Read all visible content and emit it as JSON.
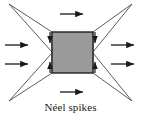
{
  "figure": {
    "caption": "Néel spikes",
    "domain_colors": {
      "core_fill": "#9a9a9a",
      "core_stroke": "#222222",
      "spike_stroke": "#4a4a4a",
      "arrow_color": "#1a1a1a",
      "background": "#ffffff"
    },
    "core": {
      "label": "central-domain",
      "x": 52,
      "y": 32,
      "width": 41,
      "height": 41
    },
    "spikes": [
      {
        "name": "spike-top-left",
        "tip_x": 9,
        "tip_y": 4,
        "base_a_x": 52,
        "base_a_y": 32,
        "base_b_x": 52,
        "base_b_y": 52
      },
      {
        "name": "spike-top-right",
        "tip_x": 132,
        "tip_y": 4,
        "base_a_x": 93,
        "base_a_y": 32,
        "base_b_x": 93,
        "base_b_y": 52
      },
      {
        "name": "spike-bottom-left",
        "tip_x": 9,
        "tip_y": 101,
        "base_a_x": 52,
        "base_a_y": 73,
        "base_b_x": 52,
        "base_b_y": 53
      },
      {
        "name": "spike-bottom-right",
        "tip_x": 132,
        "tip_y": 101,
        "base_a_x": 93,
        "base_a_y": 73,
        "base_b_x": 93,
        "base_b_y": 53
      }
    ],
    "field_arrows": [
      {
        "name": "field-arrow-left-upper",
        "x1": 5,
        "y1": 45,
        "x2": 30,
        "y2": 45,
        "direction": "right"
      },
      {
        "name": "field-arrow-left-lower",
        "x1": 5,
        "y1": 64,
        "x2": 30,
        "y2": 64,
        "direction": "right"
      },
      {
        "name": "field-arrow-right-upper",
        "x1": 111,
        "y1": 45,
        "x2": 136,
        "y2": 45,
        "direction": "right"
      },
      {
        "name": "field-arrow-right-lower",
        "x1": 111,
        "y1": 64,
        "x2": 136,
        "y2": 64,
        "direction": "right"
      },
      {
        "name": "field-arrow-top",
        "x1": 60,
        "y1": 14,
        "x2": 85,
        "y2": 14,
        "direction": "right"
      },
      {
        "name": "field-arrow-bottom",
        "x1": 60,
        "y1": 92,
        "x2": 85,
        "y2": 92,
        "direction": "right"
      }
    ],
    "spike_magnetization_arrows": [
      {
        "name": "spike-arrow-top-left",
        "x1": 50,
        "y1": 32,
        "x2": 50,
        "y2": 44,
        "direction": "down"
      },
      {
        "name": "spike-arrow-top-right",
        "x1": 95,
        "y1": 32,
        "x2": 95,
        "y2": 44,
        "direction": "down"
      },
      {
        "name": "spike-arrow-bottom-left",
        "x1": 50,
        "y1": 73,
        "x2": 50,
        "y2": 61,
        "direction": "up"
      },
      {
        "name": "spike-arrow-bottom-right",
        "x1": 95,
        "y1": 73,
        "x2": 95,
        "y2": 61,
        "direction": "up"
      }
    ]
  }
}
